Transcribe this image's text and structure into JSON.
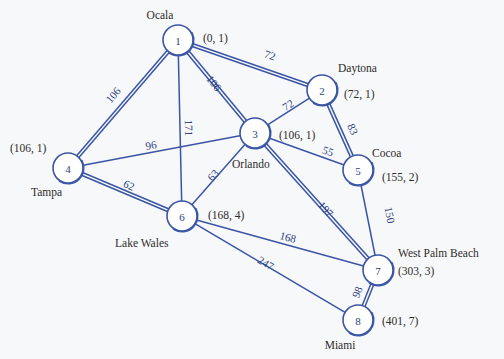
{
  "chart_data": {
    "type": "diagram",
    "nodes": [
      {
        "id": "1",
        "city": "Ocala",
        "pair": "(0, 1)",
        "cx": 178,
        "cy": 40,
        "r": 15
      },
      {
        "id": "2",
        "city": "Daytona",
        "pair": "(72, 1)",
        "cx": 322,
        "cy": 90,
        "r": 15
      },
      {
        "id": "3",
        "city": "Orlando",
        "pair": "(106, 1)",
        "cx": 255,
        "cy": 133,
        "r": 15
      },
      {
        "id": "4",
        "city": "Tampa",
        "pair": "(106, 1)",
        "cx": 68,
        "cy": 168,
        "r": 15
      },
      {
        "id": "5",
        "city": "Cocoa",
        "pair": "(155, 2)",
        "cx": 358,
        "cy": 170,
        "r": 15
      },
      {
        "id": "6",
        "city": "Lake Wales",
        "pair": "(168, 4)",
        "cx": 182,
        "cy": 216,
        "r": 15
      },
      {
        "id": "7",
        "city": "West Palm Beach",
        "pair": "(303, 3)",
        "cx": 378,
        "cy": 270,
        "r": 15
      },
      {
        "id": "8",
        "city": "Miami",
        "pair": "(401, 7)",
        "cx": 358,
        "cy": 320,
        "r": 15
      }
    ],
    "edges": [
      {
        "from": "1",
        "to": "2",
        "weight": "72",
        "style": "double",
        "lx": 270,
        "ly": 55
      },
      {
        "from": "1",
        "to": "3",
        "weight": "106",
        "style": "double",
        "lx": 214,
        "ly": 83
      },
      {
        "from": "1",
        "to": "4",
        "weight": "106",
        "style": "double",
        "lx": 113,
        "ly": 95
      },
      {
        "from": "1",
        "to": "6",
        "weight": "171",
        "style": "single",
        "lx": 189,
        "ly": 128
      },
      {
        "from": "2",
        "to": "3",
        "weight": "72",
        "style": "single",
        "lx": 288,
        "ly": 105
      },
      {
        "from": "2",
        "to": "5",
        "weight": "83",
        "style": "double",
        "lx": 353,
        "ly": 129
      },
      {
        "from": "3",
        "to": "4",
        "weight": "96",
        "style": "single",
        "lx": 151,
        "ly": 145
      },
      {
        "from": "3",
        "to": "5",
        "weight": "55",
        "style": "single",
        "lx": 328,
        "ly": 151
      },
      {
        "from": "3",
        "to": "6",
        "weight": "63",
        "style": "single",
        "lx": 213,
        "ly": 175
      },
      {
        "from": "3",
        "to": "7",
        "weight": "197",
        "style": "double",
        "lx": 326,
        "ly": 209
      },
      {
        "from": "4",
        "to": "6",
        "weight": "62",
        "style": "double",
        "lx": 129,
        "ly": 185
      },
      {
        "from": "5",
        "to": "7",
        "weight": "150",
        "style": "single",
        "lx": 390,
        "ly": 215
      },
      {
        "from": "6",
        "to": "7",
        "weight": "168",
        "style": "single",
        "lx": 288,
        "ly": 237
      },
      {
        "from": "6",
        "to": "8",
        "weight": "247",
        "style": "single",
        "lx": 266,
        "ly": 263
      },
      {
        "from": "7",
        "to": "8",
        "weight": "98",
        "style": "double",
        "lx": 357,
        "ly": 292
      }
    ],
    "labels": {
      "cities": [
        {
          "text": "Ocala",
          "x": 160,
          "y": 15,
          "anchor": "middle"
        },
        {
          "text": "Daytona",
          "x": 338,
          "y": 68,
          "anchor": "start"
        },
        {
          "text": "Orlando",
          "x": 232,
          "y": 164,
          "anchor": "start"
        },
        {
          "text": "Tampa",
          "x": 31,
          "y": 192,
          "anchor": "start"
        },
        {
          "text": "Cocoa",
          "x": 372,
          "y": 153,
          "anchor": "start"
        },
        {
          "text": "Lake Wales",
          "x": 115,
          "y": 243,
          "anchor": "start"
        },
        {
          "text": "West Palm Beach",
          "x": 398,
          "y": 253,
          "anchor": "start"
        },
        {
          "text": "Miami",
          "x": 340,
          "y": 345,
          "anchor": "middle"
        }
      ],
      "pairs": [
        {
          "text": "(0, 1)",
          "x": 203,
          "y": 38,
          "anchor": "start"
        },
        {
          "text": "(72, 1)",
          "x": 344,
          "y": 94,
          "anchor": "start"
        },
        {
          "text": "(106, 1)",
          "x": 279,
          "y": 135,
          "anchor": "start"
        },
        {
          "text": "(106, 1)",
          "x": 10,
          "y": 148,
          "anchor": "start"
        },
        {
          "text": "(155, 2)",
          "x": 382,
          "y": 177,
          "anchor": "start"
        },
        {
          "text": "(168, 4)",
          "x": 208,
          "y": 215,
          "anchor": "start"
        },
        {
          "text": "(303, 3)",
          "x": 398,
          "y": 271,
          "anchor": "start"
        },
        {
          "text": "(401, 7)",
          "x": 382,
          "y": 321,
          "anchor": "start"
        }
      ]
    },
    "colors": {
      "edge": "#3a55a5",
      "node_fill": "#ffffff",
      "node_stroke": "#3a55a5",
      "text": "#2e2c2a",
      "background": "#f7f8fa"
    }
  }
}
